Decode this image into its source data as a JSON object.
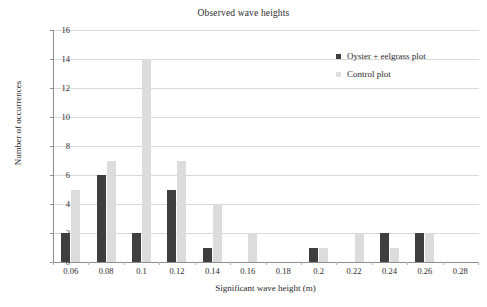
{
  "chart_data": {
    "type": "bar",
    "title": "Observed wave heights",
    "xlabel": "Significant wave height (m)",
    "ylabel": "Number of occurrences",
    "categories": [
      "0.06",
      "0.08",
      "0.1",
      "0.12",
      "0.14",
      "0.16",
      "0.18",
      "0.2",
      "0.22",
      "0.24",
      "0.26",
      "0.28"
    ],
    "series": [
      {
        "name": "Oyster + eelgrass plot",
        "color": "#3f3f3f",
        "values": [
          2,
          6,
          2,
          5,
          1,
          0,
          0,
          1,
          0,
          2,
          2,
          0
        ]
      },
      {
        "name": "Control plot",
        "color": "#dcdcdc",
        "values": [
          5,
          7,
          14,
          7,
          4,
          2,
          0,
          1,
          2,
          1,
          2,
          0
        ]
      }
    ],
    "ylim": [
      0,
      16
    ],
    "ytick_values": [
      0,
      2,
      4,
      6,
      8,
      10,
      12,
      14,
      16
    ],
    "ytick_labels": [
      "0",
      "2",
      "4",
      "6",
      "8",
      "10",
      "12",
      "14",
      "16"
    ],
    "grid": "horizontal",
    "legend_position": "top-right"
  }
}
